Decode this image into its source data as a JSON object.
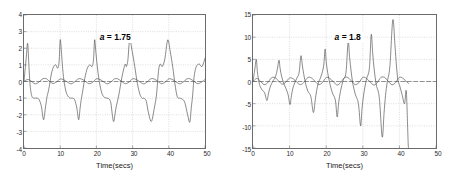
{
  "figure": {
    "background": "#ffffff",
    "axis_color": "#6b6b6b",
    "grid_color": "#b9b9b9",
    "trace_color": "#4a4a4a"
  },
  "panels": [
    {
      "id": "left",
      "title_var": "a",
      "title_eq": " = ",
      "title_value": "1.75",
      "title_full": "a = 1.75",
      "xlabel": "Time(secs)",
      "ylabel": "",
      "xticks": [
        "0",
        "10",
        "20",
        "30",
        "40",
        "50"
      ],
      "yticks": [
        "4",
        "3",
        "2",
        "1",
        "0",
        "-1",
        "-2",
        "-3",
        "-4"
      ]
    },
    {
      "id": "right",
      "title_var": "a",
      "title_eq": " = ",
      "title_value": "1.8",
      "title_full": "a = 1.8",
      "xlabel": "Time(secs)",
      "ylabel": "",
      "xticks": [
        "0",
        "10",
        "20",
        "30",
        "40",
        "50"
      ],
      "yticks": [
        "15",
        "10",
        "5",
        "0",
        "-5",
        "-10",
        "-15"
      ]
    }
  ],
  "chart_data": [
    {
      "type": "line",
      "title": "a = 1.75",
      "xlabel": "Time(secs)",
      "ylabel": "",
      "xlim": [
        0,
        50
      ],
      "ylim": [
        -4,
        4
      ],
      "xticks": [
        0,
        10,
        20,
        30,
        40,
        50
      ],
      "yticks": [
        -4,
        -3,
        -2,
        -1,
        0,
        1,
        2,
        3,
        4
      ],
      "grid": true,
      "legend": "none",
      "annotations": [
        {
          "text": "a = 1.75",
          "x": 22,
          "y": 3.35
        }
      ],
      "series": [
        {
          "name": "large-amplitude-trace",
          "description": "Chaotic spiky oscillation, period about 9.1 s, positive spikes near +2.5 and negative spikes near -2.5, terminating at t=50",
          "x": [
            0.0,
            0.6,
            1.0,
            1.3,
            1.6,
            1.9,
            2.2,
            2.6,
            3.0,
            3.6,
            4.2,
            4.8,
            5.4,
            5.9,
            6.3,
            6.6,
            6.9,
            7.2,
            7.6,
            8.2,
            8.8,
            9.3,
            9.7,
            10.0,
            10.3,
            10.6,
            11.0,
            11.6,
            12.2,
            12.8,
            13.4,
            14.0,
            14.6,
            15.1,
            15.5,
            15.8,
            16.2,
            16.8,
            17.5,
            18.2,
            18.8,
            19.2,
            19.5,
            19.8,
            20.2,
            20.8,
            21.5,
            22.2,
            22.9,
            23.5,
            24.0,
            24.4,
            24.8,
            25.4,
            26.2,
            27.0,
            27.6,
            28.0,
            28.3,
            28.7,
            29.2,
            29.9,
            30.6,
            31.3,
            32.0,
            32.6,
            33.0,
            33.4,
            33.8,
            34.4,
            35.2,
            36.0,
            36.6,
            37.0,
            37.3,
            37.7,
            38.2,
            38.9,
            39.7,
            40.4,
            41.1,
            41.7,
            42.2,
            42.6,
            43.0,
            43.6,
            44.4,
            45.2,
            45.8,
            46.2,
            46.6,
            47.0,
            47.6,
            48.4,
            49.2,
            50.0
          ],
          "y": [
            0.0,
            1.4,
            2.3,
            1.2,
            0.0,
            -0.6,
            -0.9,
            -1.0,
            -1.0,
            -1.0,
            -1.1,
            -1.5,
            -2.3,
            -1.6,
            -1.0,
            -0.7,
            -0.4,
            0.0,
            0.5,
            0.9,
            1.0,
            0.8,
            1.2,
            2.5,
            1.9,
            1.0,
            0.1,
            -0.6,
            -0.9,
            -1.0,
            -1.0,
            -1.1,
            -1.6,
            -2.3,
            -1.6,
            -1.1,
            -0.6,
            0.2,
            0.8,
            1.0,
            0.9,
            1.3,
            2.5,
            1.9,
            1.0,
            0.0,
            -0.7,
            -0.95,
            -1.0,
            -1.05,
            -1.3,
            -2.0,
            -2.4,
            -1.6,
            -0.8,
            0.2,
            0.8,
            1.05,
            0.9,
            1.3,
            2.5,
            1.8,
            0.9,
            -0.1,
            -0.75,
            -1.0,
            -1.0,
            -1.05,
            -1.2,
            -1.9,
            -2.4,
            -1.6,
            -0.8,
            0.25,
            0.85,
            1.05,
            0.9,
            1.35,
            2.5,
            1.8,
            0.85,
            -0.15,
            -0.8,
            -1.0,
            -1.0,
            -1.05,
            -1.25,
            -2.0,
            -2.45,
            -1.6,
            -0.8,
            0.3,
            0.9,
            1.05,
            0.9,
            1.4,
            -2.0
          ]
        },
        {
          "name": "small-amplitude-trace",
          "description": "Low amplitude quasi-periodic ripple oscillating between about -0.15 and +0.2 around zero",
          "x": [
            0,
            1,
            2,
            3,
            4,
            5,
            6,
            7,
            8,
            9,
            10,
            11,
            12,
            13,
            14,
            15,
            16,
            17,
            18,
            19,
            20,
            21,
            22,
            23,
            24,
            25,
            26,
            27,
            28,
            29,
            30,
            31,
            32,
            33,
            34,
            35,
            36,
            37,
            38,
            39,
            40,
            41,
            42,
            43,
            44,
            45,
            46,
            47,
            48,
            49,
            50
          ],
          "y": [
            0.0,
            0.12,
            0.02,
            -0.14,
            -0.06,
            0.14,
            0.18,
            0.02,
            -0.12,
            -0.02,
            0.15,
            0.1,
            -0.04,
            -0.14,
            -0.02,
            0.16,
            0.14,
            0.0,
            -0.13,
            -0.04,
            0.16,
            0.12,
            -0.02,
            -0.14,
            -0.03,
            0.16,
            0.15,
            0.0,
            -0.13,
            -0.04,
            0.16,
            0.12,
            -0.02,
            -0.14,
            -0.03,
            0.16,
            0.15,
            0.0,
            -0.13,
            -0.04,
            0.16,
            0.12,
            -0.02,
            -0.14,
            -0.03,
            0.16,
            0.15,
            0.0,
            -0.13,
            -0.04,
            0.12
          ]
        },
        {
          "name": "zero-reference-line",
          "description": "Horizontal dashed line at y = 0 spanning the full x range",
          "style": "dashed",
          "x": [
            0,
            50
          ],
          "y": [
            0,
            0
          ]
        }
      ]
    },
    {
      "type": "line",
      "title": "a = 1.8",
      "xlabel": "Time(secs)",
      "ylabel": "",
      "xlim": [
        0,
        50
      ],
      "ylim": [
        -15,
        15
      ],
      "xticks": [
        0,
        10,
        20,
        30,
        40,
        50
      ],
      "yticks": [
        -15,
        -10,
        -5,
        0,
        5,
        10,
        15
      ],
      "grid": true,
      "legend": "none",
      "annotations": [
        {
          "text": "a = 1.8",
          "x": 23,
          "y": 12.8
        }
      ],
      "series": [
        {
          "name": "large-amplitude-trace",
          "description": "Chaotic spiky oscillation with growing envelope: spikes rise from about +5 early to +14 near t=39, negative spikes deepen from -4 to -15, signal terminates abruptly at about t=42.5",
          "x": [
            0.0,
            0.5,
            0.9,
            1.2,
            1.6,
            2.0,
            2.6,
            3.2,
            3.8,
            4.2,
            4.6,
            5.0,
            5.6,
            6.2,
            6.7,
            7.1,
            7.4,
            7.8,
            8.4,
            9.0,
            9.6,
            10.1,
            10.5,
            10.9,
            11.4,
            12.0,
            12.6,
            13.1,
            13.5,
            13.9,
            14.4,
            15.0,
            15.8,
            16.5,
            17.0,
            17.4,
            17.9,
            18.6,
            19.3,
            19.7,
            20.0,
            20.4,
            21.0,
            21.7,
            22.5,
            23.0,
            23.4,
            23.9,
            24.6,
            25.4,
            26.0,
            26.4,
            26.8,
            27.3,
            28.0,
            28.8,
            29.4,
            29.8,
            30.3,
            31.0,
            31.8,
            32.3,
            32.7,
            33.1,
            33.7,
            34.5,
            35.3,
            35.8,
            36.2,
            36.7,
            37.4,
            38.2,
            38.8,
            39.2,
            39.6,
            40.1,
            40.8,
            41.4,
            41.8,
            42.0,
            42.2,
            42.4,
            42.5
          ],
          "y": [
            0.0,
            2.8,
            5.0,
            2.2,
            0.0,
            -1.2,
            -2.0,
            -2.6,
            -4.3,
            -2.8,
            -1.5,
            -0.6,
            0.3,
            1.2,
            3.0,
            4.8,
            3.0,
            1.2,
            -0.4,
            -1.6,
            -3.0,
            -5.2,
            -3.2,
            -1.5,
            -0.3,
            0.8,
            2.0,
            5.8,
            3.5,
            1.5,
            -0.6,
            -2.2,
            -3.4,
            -7.0,
            -4.2,
            -2.0,
            -0.2,
            1.2,
            3.5,
            7.3,
            4.5,
            2.0,
            -0.5,
            -2.6,
            -4.2,
            -8.0,
            -4.8,
            -2.2,
            0.2,
            2.0,
            8.9,
            5.4,
            2.4,
            -0.6,
            -3.0,
            -5.0,
            -10.0,
            -6.0,
            -2.6,
            0.5,
            3.0,
            10.6,
            6.4,
            2.8,
            -0.8,
            -3.6,
            -12.5,
            -7.2,
            -3.2,
            0.0,
            3.4,
            13.9,
            8.0,
            3.5,
            0.3,
            -1.0,
            -3.2,
            -5.0,
            -2.0,
            -4.0,
            -9.0,
            -14.0,
            -15.0
          ]
        },
        {
          "name": "small-amplitude-trace",
          "description": "Low amplitude quasi-periodic ripple oscillating between about -0.8 and +1.0 around zero, ending near t=42.5",
          "x": [
            0,
            1,
            2,
            3,
            4,
            5,
            6,
            7,
            8,
            9,
            10,
            11,
            12,
            13,
            14,
            15,
            16,
            17,
            18,
            19,
            20,
            21,
            22,
            23,
            24,
            25,
            26,
            27,
            28,
            29,
            30,
            31,
            32,
            33,
            34,
            35,
            36,
            37,
            38,
            39,
            40,
            41,
            42,
            42.5
          ],
          "y": [
            0.0,
            0.7,
            0.1,
            -0.7,
            -0.3,
            0.8,
            0.9,
            0.1,
            -0.6,
            -0.1,
            0.8,
            0.6,
            -0.2,
            -0.7,
            -0.1,
            0.9,
            0.8,
            0.0,
            -0.7,
            -0.2,
            0.9,
            0.7,
            -0.1,
            -0.8,
            -0.2,
            0.9,
            0.85,
            0.0,
            -0.7,
            -0.2,
            0.95,
            0.7,
            -0.1,
            -0.8,
            -0.2,
            0.95,
            0.9,
            0.0,
            -0.75,
            -0.2,
            0.95,
            0.7,
            -0.1,
            -0.4
          ]
        },
        {
          "name": "zero-reference-line",
          "description": "Horizontal dashed line at y = 0 spanning the full x range",
          "style": "dashed",
          "x": [
            0,
            50
          ],
          "y": [
            0,
            0
          ]
        }
      ]
    }
  ]
}
